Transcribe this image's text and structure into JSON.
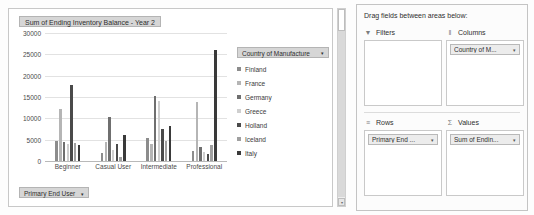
{
  "chart": {
    "title_button": "Sum of Ending Inventory Balance - Year 2",
    "row_field_button": "Primary End User",
    "legend_header": "Country of Manufacture",
    "caret": "▾"
  },
  "chart_data": {
    "type": "bar",
    "title": "Sum of Ending Inventory Balance - Year 2",
    "xlabel": "",
    "ylabel": "",
    "ylim": [
      0,
      30000
    ],
    "yticks": [
      0,
      5000,
      10000,
      15000,
      20000,
      25000,
      30000
    ],
    "ytick_labels": [
      "0",
      "5000",
      "10000",
      "15000",
      "20000",
      "25000",
      "30000"
    ],
    "grid": true,
    "legend_position": "right",
    "legend_title": "Country of Manufacture",
    "categories": [
      "Beginner",
      "Casual User",
      "Intermediate",
      "Professional"
    ],
    "series": [
      {
        "name": "Finland",
        "color": "#8c8c8c",
        "values": [
          4800,
          1900,
          5400,
          2300
        ]
      },
      {
        "name": "France",
        "color": "#b5b5b5",
        "values": [
          12300,
          4400,
          4100,
          13800
        ]
      },
      {
        "name": "Germany",
        "color": "#6f6f6f",
        "values": [
          4500,
          10200,
          15200,
          3300
        ]
      },
      {
        "name": "Greece",
        "color": "#cfcfcf",
        "values": [
          4000,
          2500,
          14000,
          2000
        ]
      },
      {
        "name": "Holland",
        "color": "#4a4a4a",
        "values": [
          17900,
          4100,
          7500,
          1700
        ]
      },
      {
        "name": "Iceland",
        "color": "#a0a0a0",
        "values": [
          4200,
          900,
          4600,
          3800
        ]
      },
      {
        "name": "Italy",
        "color": "#3a3a3a",
        "values": [
          3800,
          6000,
          8200,
          26100
        ]
      }
    ],
    "extra_bars_note": "grouped clustered columns, 7 countries per category"
  },
  "scrollbar": {
    "down_arrow": "▾"
  },
  "panel": {
    "caption": "Drag fields between areas below:",
    "areas": [
      {
        "id": "filters",
        "label": "Filters",
        "icon": "filter-funnel-icon",
        "glyph": "▼",
        "chips": []
      },
      {
        "id": "columns",
        "label": "Columns",
        "icon": "columns-icon",
        "glyph": "‖",
        "chips": [
          {
            "label": "Country of M...",
            "caret": "▾"
          }
        ]
      },
      {
        "id": "rows",
        "label": "Rows",
        "icon": "rows-icon",
        "glyph": "≡",
        "chips": [
          {
            "label": "Primary End ...",
            "caret": "▾"
          }
        ]
      },
      {
        "id": "values",
        "label": "Values",
        "icon": "sigma-icon",
        "glyph": "Σ",
        "chips": [
          {
            "label": "Sum of Endin...",
            "caret": "▾"
          }
        ]
      }
    ]
  }
}
